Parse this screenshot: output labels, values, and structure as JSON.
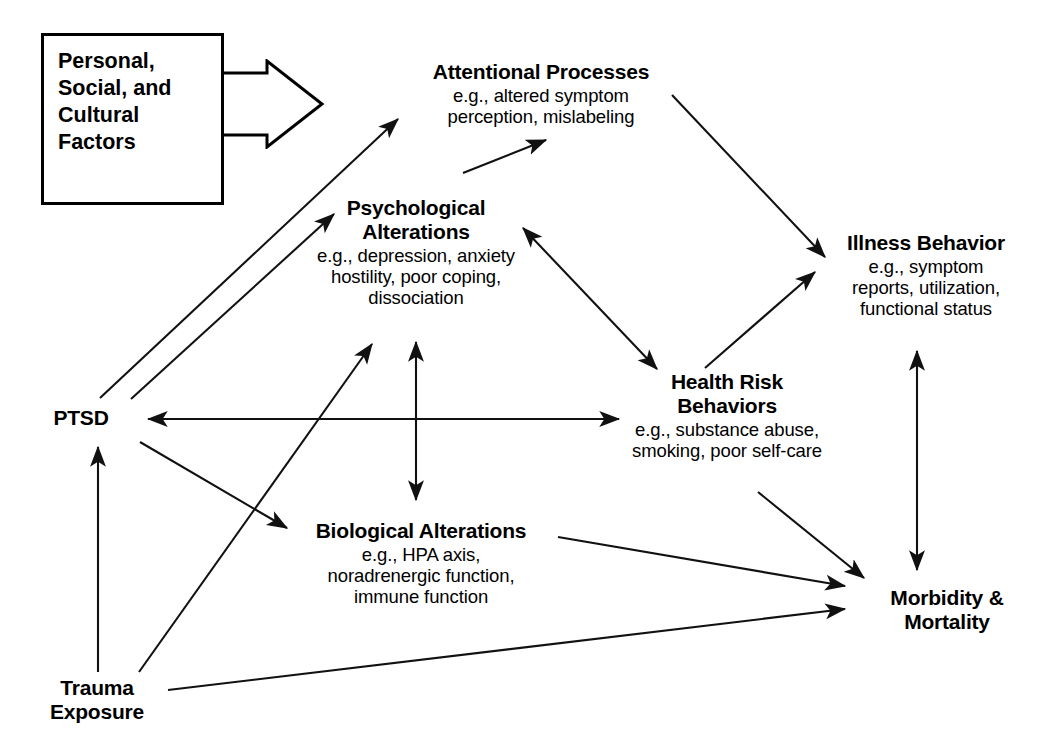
{
  "figure": {
    "kind": "conceptual-model-diagram",
    "ink_color": "#000000",
    "background_color": "#ffffff"
  },
  "callout": {
    "name": "personal-social-cultural-factors",
    "lines": [
      "Personal,",
      "Social, and",
      "Cultural",
      "Factors"
    ],
    "text": "Personal, Social, and Cultural Factors",
    "shape": "rectangle-with-right-pointing-block-arrow"
  },
  "nodes": [
    {
      "id": "attentional-processes",
      "title": "Attentional Processes",
      "detail_lines": [
        "e.g., altered symptom",
        "perception, mislabeling"
      ]
    },
    {
      "id": "psychological-alterations",
      "title": "Psychological Alterations",
      "title_lines": [
        "Psychological",
        "Alterations"
      ],
      "detail_lines": [
        "e.g., depression, anxiety",
        "hostility, poor coping,",
        "dissociation"
      ]
    },
    {
      "id": "illness-behavior",
      "title": "Illness Behavior",
      "detail_lines": [
        "e.g., symptom",
        "reports, utilization,",
        "functional status"
      ]
    },
    {
      "id": "health-risk-behaviors",
      "title": "Health Risk Behaviors",
      "title_lines": [
        "Health Risk",
        "Behaviors"
      ],
      "detail_lines": [
        "e.g., substance abuse,",
        "smoking, poor self-care"
      ]
    },
    {
      "id": "biological-alterations",
      "title": "Biological Alterations",
      "detail_lines": [
        "e.g., HPA axis,",
        "noradrenergic function,",
        "immune function"
      ]
    },
    {
      "id": "ptsd",
      "title": "PTSD",
      "detail_lines": []
    },
    {
      "id": "trauma-exposure",
      "title": "Trauma Exposure",
      "title_lines": [
        "Trauma",
        "Exposure"
      ],
      "detail_lines": []
    },
    {
      "id": "morbidity-mortality",
      "title": "Morbidity & Mortality",
      "title_lines": [
        "Morbidity &",
        "Mortality"
      ],
      "detail_lines": []
    }
  ],
  "node_text": {
    "attentional_processes": {
      "title": "Attentional Processes",
      "d1": "e.g., altered symptom",
      "d2": "perception, mislabeling"
    },
    "psychological_alterations": {
      "t1": "Psychological",
      "t2": "Alterations",
      "d1": "e.g., depression, anxiety",
      "d2": "hostility, poor coping,",
      "d3": "dissociation"
    },
    "illness_behavior": {
      "title": "Illness Behavior",
      "d1": "e.g., symptom",
      "d2": "reports, utilization,",
      "d3": "functional status"
    },
    "health_risk_behaviors": {
      "t1": "Health Risk",
      "t2": "Behaviors",
      "d1": "e.g., substance abuse,",
      "d2": "smoking, poor self-care"
    },
    "biological_alterations": {
      "title": "Biological Alterations",
      "d1": "e.g., HPA axis,",
      "d2": "noradrenergic function,",
      "d3": "immune function"
    },
    "ptsd": {
      "title": "PTSD"
    },
    "trauma_exposure": {
      "t1": "Trauma",
      "t2": "Exposure"
    },
    "morbidity_mortality": {
      "t1": "Morbidity &",
      "t2": "Mortality"
    },
    "factors": {
      "l1": "Personal,",
      "l2": "Social, and",
      "l3": "Cultural",
      "l4": "Factors"
    }
  },
  "edges": [
    {
      "id": "factors-to-model",
      "from": "personal-social-cultural-factors",
      "to": "model",
      "style": "block-arrow",
      "heads": "single"
    },
    {
      "id": "ptsd-to-attentional",
      "from": "ptsd",
      "to": "attentional-processes",
      "heads": "single"
    },
    {
      "id": "ptsd-to-psychological",
      "from": "ptsd",
      "to": "psychological-alterations",
      "heads": "single"
    },
    {
      "id": "psychological-to-attentional",
      "from": "psychological-alterations",
      "to": "attentional-processes",
      "heads": "single"
    },
    {
      "id": "attentional-to-illness",
      "from": "attentional-processes",
      "to": "illness-behavior",
      "heads": "single"
    },
    {
      "id": "psychological-health-risk",
      "from": "psychological-alterations",
      "to": "health-risk-behaviors",
      "heads": "double"
    },
    {
      "id": "health-risk-to-illness",
      "from": "health-risk-behaviors",
      "to": "illness-behavior",
      "heads": "single"
    },
    {
      "id": "ptsd-health-risk",
      "from": "ptsd",
      "to": "health-risk-behaviors",
      "heads": "double"
    },
    {
      "id": "psychological-biological",
      "from": "psychological-alterations",
      "to": "biological-alterations",
      "heads": "double"
    },
    {
      "id": "ptsd-to-biological",
      "from": "ptsd",
      "to": "biological-alterations",
      "heads": "single"
    },
    {
      "id": "trauma-to-ptsd",
      "from": "trauma-exposure",
      "to": "ptsd",
      "heads": "single"
    },
    {
      "id": "trauma-to-psychological",
      "from": "trauma-exposure",
      "to": "psychological-alterations",
      "heads": "single"
    },
    {
      "id": "trauma-to-morbidity",
      "from": "trauma-exposure",
      "to": "morbidity-mortality",
      "heads": "single"
    },
    {
      "id": "biological-to-morbidity",
      "from": "biological-alterations",
      "to": "morbidity-mortality",
      "heads": "single"
    },
    {
      "id": "health-risk-to-morbidity",
      "from": "health-risk-behaviors",
      "to": "morbidity-mortality",
      "heads": "single"
    },
    {
      "id": "illness-morbidity",
      "from": "illness-behavior",
      "to": "morbidity-mortality",
      "heads": "double"
    }
  ]
}
